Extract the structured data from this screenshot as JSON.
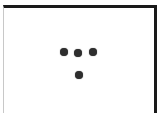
{
  "figure": {
    "colors": {
      "frame_dark": "#1a1a1a",
      "frame_light": "#c8c8c8",
      "dot": "#2e2e2e",
      "background": "#ffffff"
    },
    "dots": [
      {
        "row": 1,
        "position": "left"
      },
      {
        "row": 1,
        "position": "center"
      },
      {
        "row": 1,
        "position": "right"
      },
      {
        "row": 2,
        "position": "center"
      }
    ]
  }
}
